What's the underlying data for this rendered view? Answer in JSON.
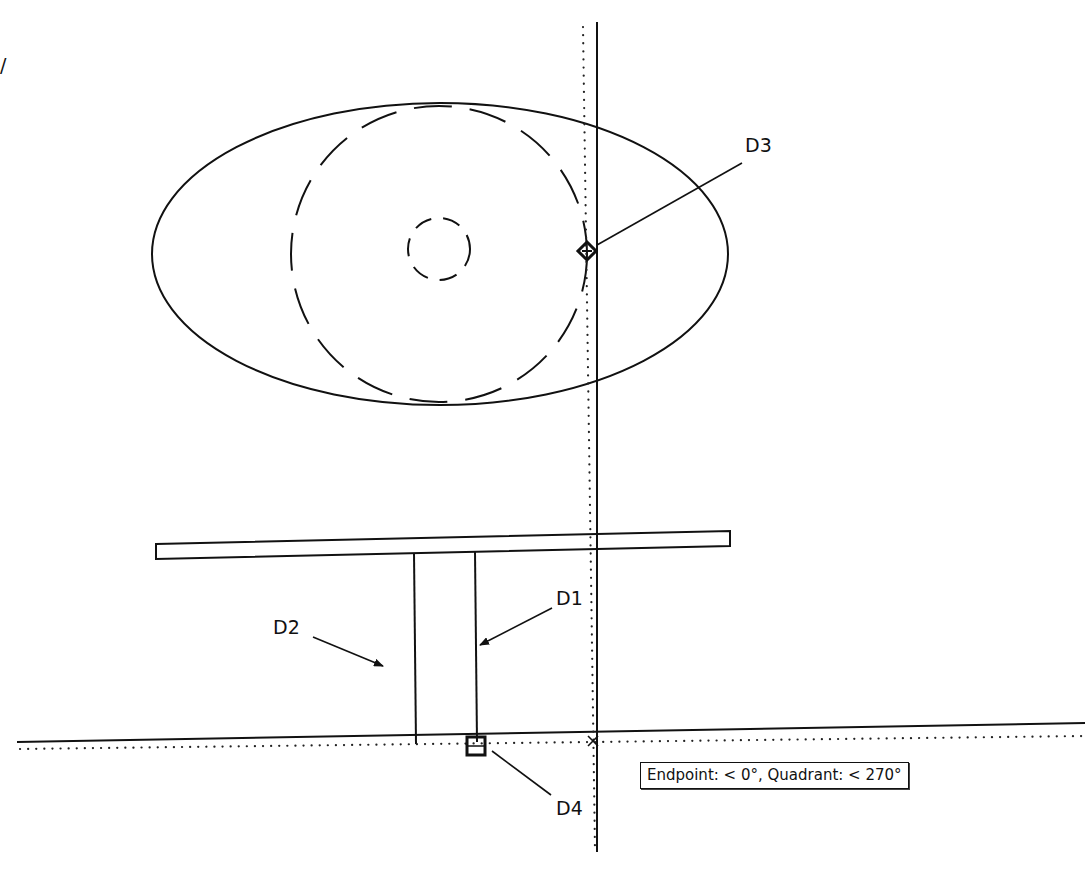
{
  "drawing": {
    "colors": {
      "background": "#ffffff",
      "ink": "#111111"
    },
    "ellipse": {
      "cx": 440,
      "cy": 254,
      "rx": 288,
      "ry": 151
    },
    "dashed_circle_large": {
      "cx": 439,
      "cy": 254,
      "r": 148,
      "dash": "38 18"
    },
    "dashed_circle_small": {
      "cx": 439,
      "cy": 249,
      "r": 31,
      "dash": "18 12"
    },
    "slab": {
      "points": "156,544 730,531 730,546 156,559"
    },
    "column": {
      "left": {
        "x1": 414,
        "y1": 553,
        "x2": 416,
        "y2": 744
      },
      "right": {
        "x1": 475,
        "y1": 552,
        "x2": 477,
        "y2": 742
      }
    },
    "ground_line": {
      "x1": 17,
      "y1": 742,
      "x2": 1085,
      "y2": 723
    },
    "tracking_lines": {
      "horizontal_dotted": {
        "x1": 20,
        "y1": 749,
        "x2": 1085,
        "y2": 736
      },
      "vertical_dotted": {
        "x1": 583,
        "y1": 27,
        "x2": 595,
        "y2": 850
      }
    },
    "vertical_line": {
      "x1": 597,
      "y1": 22,
      "x2": 597,
      "y2": 852
    },
    "markers": {
      "quadrant_diamond": {
        "x": 587,
        "y": 251,
        "size": 9,
        "name": "quadrant-snap-marker"
      },
      "endpoint_square": {
        "x": 476,
        "y": 746,
        "size": 9,
        "name": "endpoint-snap-marker"
      },
      "intersection_x": {
        "x": 593,
        "y": 741,
        "size": 5,
        "name": "tracking-intersection-marker"
      }
    },
    "callouts": [
      {
        "id": "D1",
        "text": "D1",
        "tx": 556,
        "ty": 605,
        "x1": 552,
        "y1": 608,
        "x2": 480,
        "y2": 645,
        "arrow": true
      },
      {
        "id": "D2",
        "text": "D2",
        "tx": 273,
        "ty": 634,
        "x1": 313,
        "y1": 637,
        "x2": 383,
        "y2": 666,
        "arrow": true
      },
      {
        "id": "D3",
        "text": "D3",
        "tx": 745,
        "ty": 152,
        "x1": 742,
        "y1": 163,
        "x2": 597,
        "y2": 245,
        "arrow": false
      },
      {
        "id": "D4",
        "text": "D4",
        "tx": 556,
        "ty": 815,
        "x1": 551,
        "y1": 795,
        "x2": 492,
        "y2": 751,
        "arrow": false
      }
    ],
    "edge_mark": {
      "text": "/",
      "x": 0,
      "y": 72
    }
  },
  "tooltip": {
    "text": "Endpoint: < 0°, Quadrant: < 270°",
    "x": 640,
    "y": 762
  }
}
